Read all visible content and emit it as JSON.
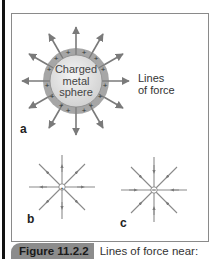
{
  "figure": {
    "number": "Figure 11.2.2",
    "caption": "Lines of force near:",
    "panels": [
      {
        "id": "a",
        "label": "a",
        "sphere_text": [
          "Charged",
          "metal",
          "sphere"
        ],
        "charge": "+",
        "field_direction": "outward",
        "annotation": [
          "Lines",
          "of force"
        ]
      },
      {
        "id": "b",
        "label": "b",
        "charge": "+",
        "field_direction": "outward"
      },
      {
        "id": "c",
        "label": "c",
        "charge": "−",
        "field_direction": "inward"
      }
    ]
  },
  "colors": {
    "caption_tab": "#8c8c8c",
    "sphere_ring": "#a6a6a6",
    "sphere_core": "#e6e6e6",
    "arrow": "#7a7a7a",
    "frame_border": "#8a8a8a"
  }
}
